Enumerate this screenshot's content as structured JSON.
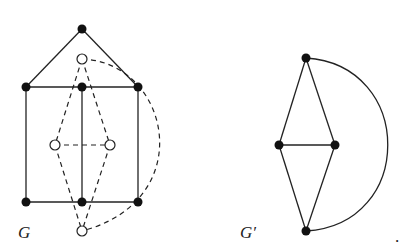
{
  "figure": {
    "graphs": [
      {
        "label": "G",
        "primal_vertices": [
          {
            "id": "a",
            "x": 82,
            "y": 29
          },
          {
            "id": "b",
            "x": 26,
            "y": 87
          },
          {
            "id": "c",
            "x": 82,
            "y": 87
          },
          {
            "id": "d",
            "x": 138,
            "y": 87
          },
          {
            "id": "e",
            "x": 26,
            "y": 202
          },
          {
            "id": "f",
            "x": 82,
            "y": 202
          },
          {
            "id": "g",
            "x": 138,
            "y": 202
          }
        ],
        "primal_edges": [
          [
            "a",
            "b"
          ],
          [
            "a",
            "d"
          ],
          [
            "b",
            "c"
          ],
          [
            "c",
            "d"
          ],
          [
            "b",
            "e"
          ],
          [
            "c",
            "f"
          ],
          [
            "d",
            "g"
          ],
          [
            "e",
            "f"
          ],
          [
            "f",
            "g"
          ]
        ],
        "dual_vertices": [
          {
            "id": "p",
            "x": 82,
            "y": 59
          },
          {
            "id": "q",
            "x": 55,
            "y": 145
          },
          {
            "id": "r",
            "x": 110,
            "y": 145
          },
          {
            "id": "s",
            "x": 82,
            "y": 231
          }
        ],
        "dual_edges": [
          [
            "p",
            "q"
          ],
          [
            "p",
            "r"
          ],
          [
            "q",
            "r"
          ],
          [
            "q",
            "s"
          ],
          [
            "r",
            "s"
          ]
        ],
        "dual_arc": {
          "from": "p",
          "to": "s",
          "style": "dashed"
        }
      },
      {
        "label": "G′",
        "vertices": [
          {
            "id": "t",
            "x": 306,
            "y": 58
          },
          {
            "id": "l",
            "x": 279,
            "y": 145
          },
          {
            "id": "m",
            "x": 335,
            "y": 145
          },
          {
            "id": "u",
            "x": 306,
            "y": 231
          }
        ],
        "edges": [
          [
            "t",
            "l"
          ],
          [
            "t",
            "m"
          ],
          [
            "l",
            "m"
          ],
          [
            "l",
            "u"
          ],
          [
            "m",
            "u"
          ]
        ],
        "arc": {
          "from": "t",
          "to": "u",
          "style": "solid"
        }
      }
    ],
    "trailing_mark": "."
  }
}
